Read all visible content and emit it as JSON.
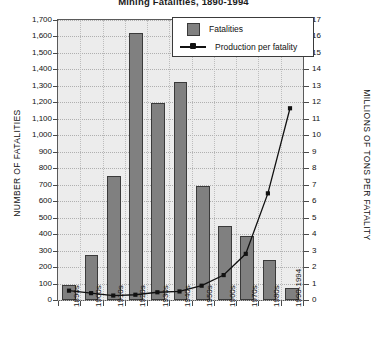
{
  "chart_data": {
    "type": "bar",
    "title": "Mining Fatalities, 1890-1994",
    "categories": [
      "1890s",
      "1900s",
      "1910s",
      "1920s",
      "1930s",
      "1940s",
      "1950s",
      "1960s",
      "1970s",
      "1980s",
      "1990-1994"
    ],
    "series": [
      {
        "name": "Fatalities",
        "type": "bar",
        "axis": "left",
        "values": [
          90,
          275,
          750,
          1620,
          1195,
          1325,
          690,
          450,
          390,
          245,
          70
        ]
      },
      {
        "name": "Production per fatality",
        "type": "line",
        "axis": "right",
        "values": [
          0.45,
          0.3,
          0.15,
          0.2,
          0.35,
          0.4,
          0.75,
          1.4,
          2.7,
          6.4,
          11.6
        ]
      }
    ],
    "xlabel": "",
    "ylabel": "NUMBER OF FATALITIES",
    "y2label": "MILLIONS OF TONS PER FATALITY",
    "ylim": [
      0,
      1700
    ],
    "y2lim": [
      0,
      17
    ],
    "yticks": [
      "0",
      "100",
      "200",
      "300",
      "400",
      "500",
      "600",
      "700",
      "800",
      "900",
      "1,000",
      "1,100",
      "1,200",
      "1,300",
      "1,400",
      "1,500",
      "1,600",
      "1,700"
    ],
    "y2ticks": [
      "0",
      "1",
      "2",
      "3",
      "4",
      "5",
      "6",
      "7",
      "8",
      "9",
      "10",
      "11",
      "12",
      "13",
      "14",
      "15",
      "16",
      "17"
    ],
    "grid": true,
    "legend_position": "top-right",
    "legend": [
      "Fatalities",
      "Production per fatality"
    ],
    "colors": {
      "bar_fill": "#808080",
      "bar_border": "#3a3a3a",
      "line": "#111111",
      "plot_background": "#ececec",
      "gridline": "#b0b0b0",
      "axis": "#5a5a5a"
    }
  }
}
